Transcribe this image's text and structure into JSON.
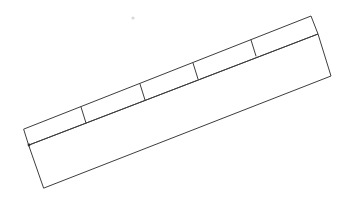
{
  "figure": {
    "background_color": "#ffffff",
    "line_color": "#3d3d3d",
    "line_width": 1,
    "fill_color": "#ffffff"
  },
  "geometry": {
    "strip": {
      "name": "upper-narrow-strip",
      "top_left": {
        "x": 24,
        "y": 129
      },
      "top_right": {
        "x": 311,
        "y": 16
      },
      "bottom_right": {
        "x": 318,
        "y": 34
      },
      "bottom_left": {
        "x": 29,
        "y": 145
      }
    },
    "band": {
      "name": "lower-wide-band",
      "top_left": {
        "x": 29,
        "y": 145
      },
      "top_right": {
        "x": 318,
        "y": 34
      },
      "bottom_right": {
        "x": 331,
        "y": 76
      },
      "bottom_left": {
        "x": 44,
        "y": 188
      }
    },
    "dividers": [
      {
        "name": "divider-1",
        "x1": 81,
        "y1": 107,
        "x2": 86,
        "y2": 123
      },
      {
        "name": "divider-2",
        "x1": 140,
        "y1": 84,
        "x2": 145,
        "y2": 100
      },
      {
        "name": "divider-3",
        "x1": 193,
        "y1": 63,
        "x2": 198,
        "y2": 79
      },
      {
        "name": "divider-4",
        "x1": 251,
        "y1": 40,
        "x2": 256,
        "y2": 56
      }
    ],
    "cells": [
      {
        "name": "cell-1",
        "index": 1
      },
      {
        "name": "cell-2",
        "index": 2
      },
      {
        "name": "cell-3",
        "index": 3
      },
      {
        "name": "cell-4",
        "index": 4
      },
      {
        "name": "cell-5",
        "index": 5
      }
    ],
    "vertex_marker": {
      "x": 29,
      "y": 145
    },
    "speck": {
      "x": 133,
      "y": 18,
      "r": 1.6,
      "color": "#d8d8d8"
    }
  },
  "counts": {
    "cell_count": "5",
    "divider_count": "4"
  },
  "labels": {
    "empty": ""
  }
}
